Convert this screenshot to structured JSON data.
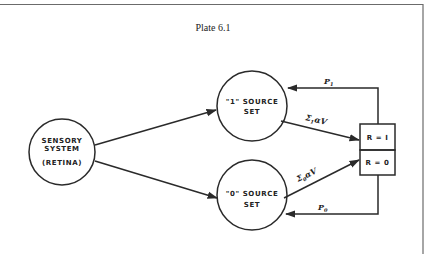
{
  "title": "Plate 6.1",
  "nodes": {
    "sensory": {
      "line1": "SENSORY",
      "line2": "SYSTEM",
      "line3": "(RETINA)"
    },
    "source1": {
      "line1": "\"1\"  SOURCE",
      "line2": "SET"
    },
    "source0": {
      "line1": "\"0\"  SOURCE",
      "line2": "SET"
    }
  },
  "response_box": {
    "top": "R = I",
    "bottom": "R = 0"
  },
  "edges": {
    "sum1": {
      "symbol": "Σ",
      "subscript": "1",
      "rest": "αV"
    },
    "sum0": {
      "symbol": "Σ",
      "subscript": "0",
      "rest": "αV"
    },
    "p1": {
      "symbol": "P",
      "subscript": "1"
    },
    "p0": {
      "symbol": "P",
      "subscript": "0"
    }
  }
}
